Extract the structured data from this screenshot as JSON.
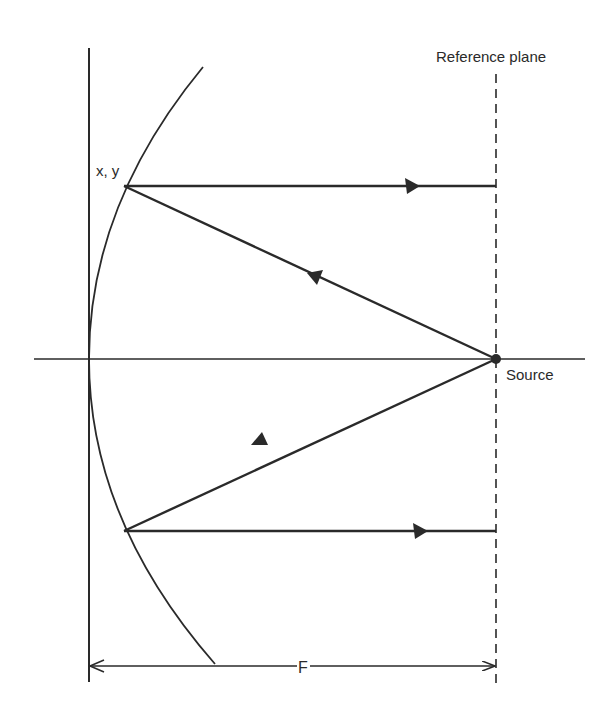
{
  "diagram": {
    "labels": {
      "reference_plane": "Reference plane",
      "point": "x, y",
      "source": "Source",
      "focal_length": "F"
    },
    "geometry": {
      "vertical_axis_x": 89,
      "horizontal_axis_y": 359,
      "reference_plane_x": 496,
      "source_point": [
        496,
        359
      ],
      "upper_reflection_point": [
        124,
        186
      ],
      "lower_reflection_point": [
        124,
        531
      ],
      "dimension_line_y": 666
    },
    "colors": {
      "ink": "#2a2a2a",
      "background": "#ffffff"
    }
  }
}
